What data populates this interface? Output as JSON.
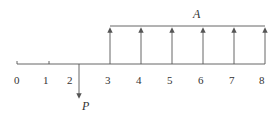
{
  "diagram": {
    "type": "cash-flow-timeline",
    "periods": [
      "0",
      "1",
      "2",
      "3",
      "4",
      "5",
      "6",
      "7",
      "8"
    ],
    "annuity": {
      "label": "A",
      "from_period": 3,
      "to_period": 8,
      "direction": "up"
    },
    "present": {
      "label": "P",
      "period": 2,
      "direction": "down"
    },
    "colors": {
      "line": "#555555",
      "text": "#333333"
    }
  }
}
